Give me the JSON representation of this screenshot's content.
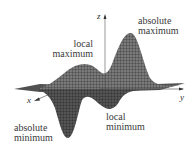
{
  "figure": {
    "axes": {
      "x": "x",
      "y": "y",
      "z": "z"
    },
    "labels": {
      "absolute_maximum": [
        "absolute",
        "maximum"
      ],
      "local_maximum": [
        "local",
        "maximum"
      ],
      "absolute_minimum": [
        "absolute",
        "minimum"
      ],
      "local_minimum": [
        "local",
        "minimum"
      ]
    },
    "colors": {
      "surface": "#555555",
      "mesh": "#222222",
      "background": "#ffffff"
    }
  }
}
